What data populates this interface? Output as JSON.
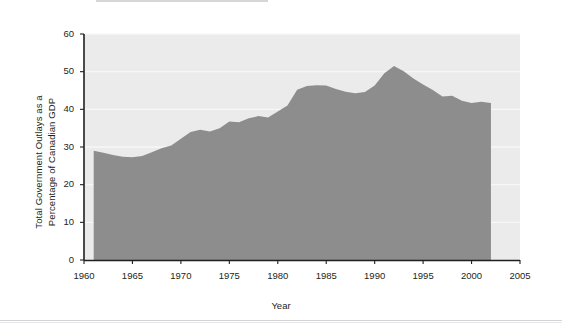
{
  "chart_data": {
    "type": "area",
    "title": "",
    "xlabel": "Year",
    "ylabel": "Total Government Outlays as a Percentage of Canadian GDP",
    "ylabel_line1": "Total Government Outlays as a",
    "ylabel_line2": "Percentage of Canadian GDP",
    "xlim": [
      1960,
      2005
    ],
    "ylim": [
      0,
      60
    ],
    "xticks": [
      "1960",
      "1965",
      "1970",
      "1975",
      "1980",
      "1985",
      "1990",
      "1995",
      "2000",
      "2005"
    ],
    "xtick_values": [
      1960,
      1965,
      1970,
      1975,
      1980,
      1985,
      1990,
      1995,
      2000,
      2005
    ],
    "yticks": [
      "0",
      "10",
      "20",
      "30",
      "40",
      "50",
      "60"
    ],
    "ytick_values": [
      0,
      10,
      20,
      30,
      40,
      50,
      60
    ],
    "grid": "horizontal",
    "legend": "none",
    "series_name": "Total Government Outlays (% of GDP)",
    "area_color": "#8d8d8d",
    "plot_background": "#ebebeb",
    "gridline_color": "#f7f7f7",
    "axis_color": "#231f20",
    "x": [
      1961,
      1962,
      1963,
      1964,
      1965,
      1966,
      1967,
      1968,
      1969,
      1970,
      1971,
      1972,
      1973,
      1974,
      1975,
      1976,
      1977,
      1978,
      1979,
      1980,
      1981,
      1982,
      1983,
      1984,
      1985,
      1986,
      1987,
      1988,
      1989,
      1990,
      1991,
      1992,
      1993,
      1994,
      1995,
      1996,
      1997,
      1998,
      1999,
      2000,
      2001,
      2002
    ],
    "values": [
      29.0,
      28.5,
      27.9,
      27.4,
      27.3,
      27.6,
      28.6,
      29.7,
      30.4,
      32.2,
      34.0,
      34.6,
      34.1,
      35.0,
      36.8,
      36.6,
      37.6,
      38.2,
      37.8,
      39.4,
      41.0,
      45.2,
      46.2,
      46.4,
      46.3,
      45.4,
      44.7,
      44.3,
      44.6,
      46.3,
      49.6,
      51.5,
      50.1,
      48.2,
      46.6,
      45.1,
      43.4,
      43.6,
      42.3,
      41.7,
      42.0,
      41.7
    ]
  },
  "figure": {
    "caption_rule_present": true,
    "footer_rule_present": true
  }
}
